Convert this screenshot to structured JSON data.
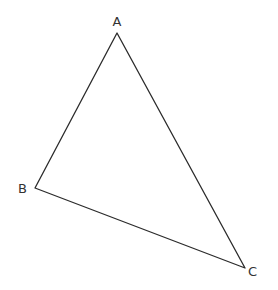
{
  "diagram": {
    "type": "triangle",
    "stroke_color": "#2b2b2b",
    "label_color": "#333333",
    "vertices": [
      {
        "name": "A",
        "x": 117,
        "y": 33,
        "label_x": 117,
        "label_y": 26,
        "anchor": "middle"
      },
      {
        "name": "B",
        "x": 35,
        "y": 188,
        "label_x": 27,
        "label_y": 193,
        "anchor": "end"
      },
      {
        "name": "C",
        "x": 245,
        "y": 268,
        "label_x": 248,
        "label_y": 276,
        "anchor": "start"
      }
    ],
    "labels": {
      "a": "A",
      "b": "B",
      "c": "C"
    }
  }
}
